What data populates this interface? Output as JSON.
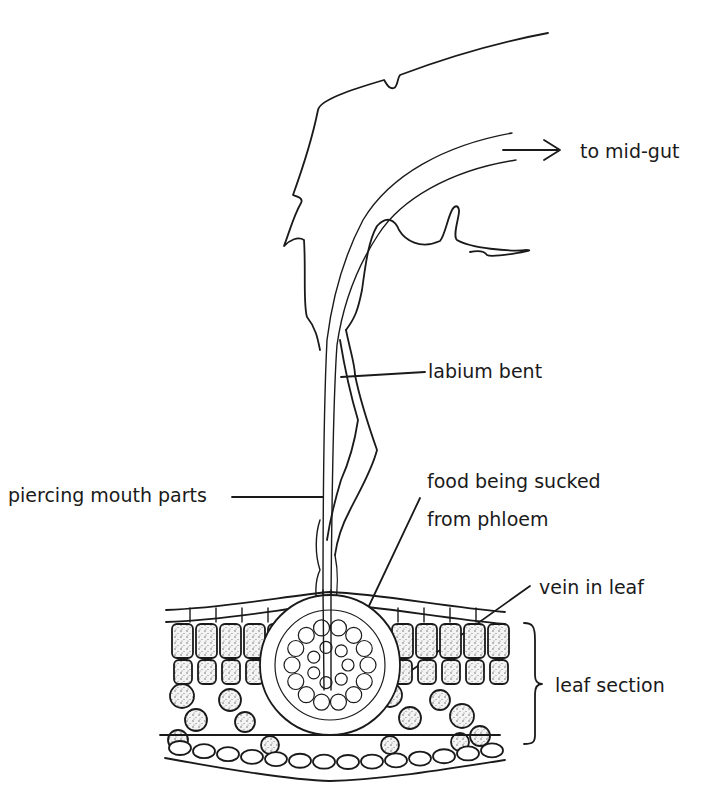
{
  "figure": {
    "ink_color": "#1a1a1a",
    "background_color": "#ffffff"
  },
  "labels": {
    "to_mid_gut": "to mid-gut",
    "labium_bent": "labium bent",
    "piercing_mouth_parts": "piercing mouth parts",
    "food_line1": "food being sucked",
    "food_line2": "from phloem",
    "vein_in_leaf": "vein in leaf",
    "leaf_section": "leaf section"
  }
}
